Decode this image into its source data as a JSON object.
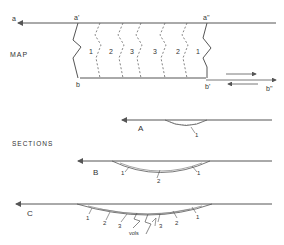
{
  "map": {
    "title": "MAP",
    "point_labels": {
      "a": "a",
      "a_prime": "a'",
      "a_double_prime": "a''",
      "b": "b",
      "b_prime": "b'",
      "b_double_prime": "b''"
    },
    "zone_labels": [
      "1",
      "2",
      "3",
      "3",
      "2",
      "1"
    ]
  },
  "sections": {
    "title": "SECTIONS",
    "A": {
      "label": "A",
      "layer_labels": [
        "1"
      ]
    },
    "B": {
      "label": "B",
      "layer_labels": [
        "1",
        "2",
        "1"
      ]
    },
    "C": {
      "label": "C",
      "layer_labels": [
        "1",
        "2",
        "3",
        "3",
        "2",
        "1"
      ],
      "annotation": "vols"
    }
  },
  "colors": {
    "line": "#555555",
    "text": "#333333",
    "background": "#ffffff"
  }
}
